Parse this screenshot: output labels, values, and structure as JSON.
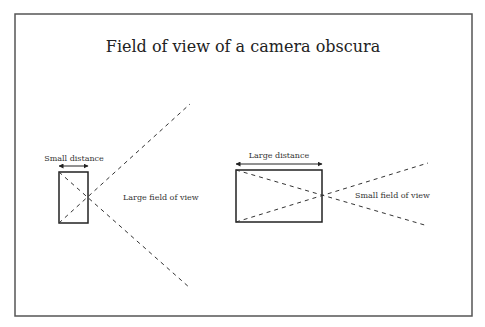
{
  "title": "Field of view of a camera obscura",
  "left_camera": {
    "distance_label": "Small distance",
    "fov_label": "Large field of view"
  },
  "right_camera": {
    "distance_label": "Large distance",
    "fov_label": "Small field of view"
  },
  "colors": {
    "stroke": "#333333",
    "frame": "#555555",
    "text": "#222222"
  }
}
